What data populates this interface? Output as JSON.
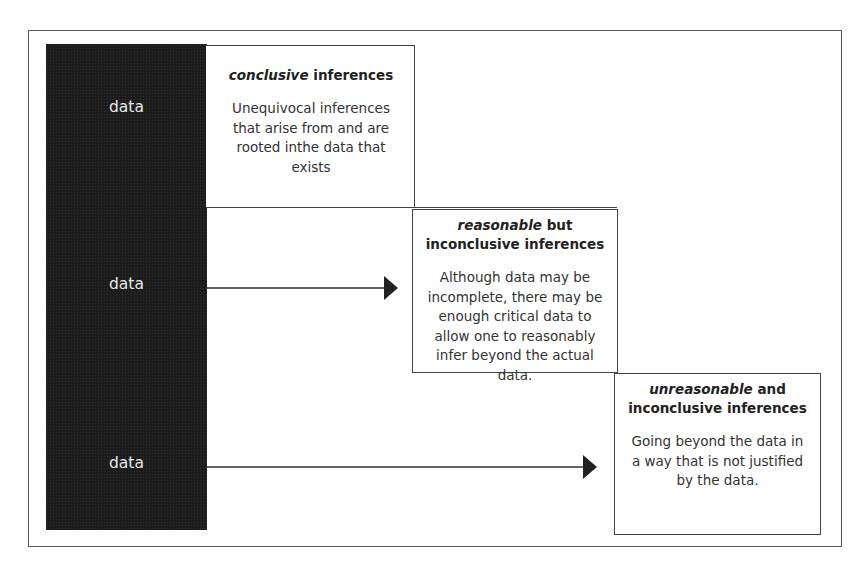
{
  "diagram": {
    "type": "inference-levels",
    "data_column": {
      "labels": [
        "data",
        "data",
        "data"
      ],
      "color": "#1c1c1c"
    },
    "boxes": [
      {
        "title_emphasis": "conclusive",
        "title_rest": " inferences",
        "title_line2": "",
        "body": "Unequivocal inferences that arise from and are rooted inthe data that exists"
      },
      {
        "title_emphasis": "reasonable",
        "title_rest": " but",
        "title_line2": "inconclusive inferences",
        "body": "Although data may be incomplete, there may be enough critical data to allow one to reasonably infer beyond the actual data."
      },
      {
        "title_emphasis": "unreasonable",
        "title_rest": " and",
        "title_line2": "inconclusive inferences",
        "body": "Going beyond the data in a way  that is not justified by the data."
      }
    ],
    "arrows": [
      {
        "from": "data-2",
        "to": "box-reasonable"
      },
      {
        "from": "data-3",
        "to": "box-unreasonable"
      }
    ]
  }
}
